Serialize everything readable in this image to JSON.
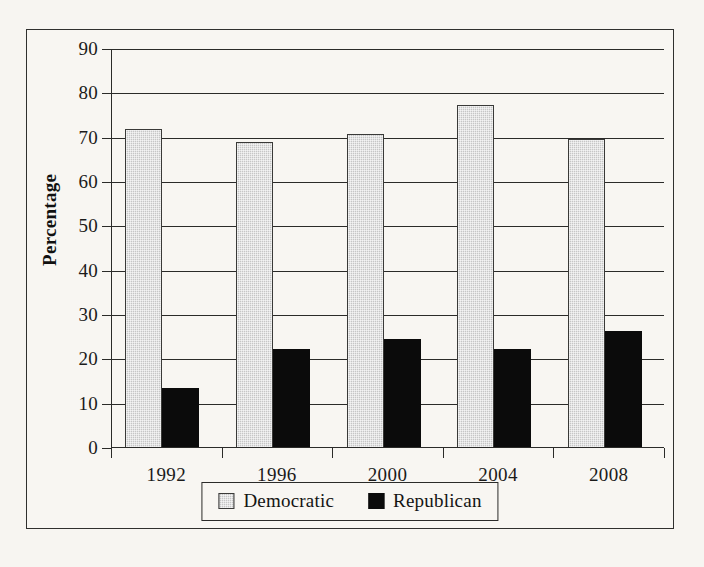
{
  "figure": {
    "background_color": "#f7f5f1",
    "frame_color": "#30302e"
  },
  "chart_data": {
    "type": "bar",
    "title": "",
    "xlabel": "",
    "ylabel": "Percentage",
    "ylim": [
      0,
      90
    ],
    "ytick_values": [
      0,
      10,
      20,
      30,
      40,
      50,
      60,
      70,
      80,
      90
    ],
    "ytick_labels": [
      "0",
      "10",
      "20",
      "30",
      "40",
      "50",
      "60",
      "70",
      "80",
      "90"
    ],
    "grid": true,
    "grid_axis": "y",
    "legend_position": "bottom-center",
    "categories": [
      "1992",
      "1996",
      "2000",
      "2004",
      "2008"
    ],
    "series": [
      {
        "name": "Democratic",
        "color": "#c6c6c6",
        "edge_color": "#3a3a38",
        "values": [
          72.0,
          69.0,
          70.8,
          77.4,
          69.8
        ]
      },
      {
        "name": "Republican",
        "color": "#0b0b0b",
        "edge_color": "#0b0b0b",
        "values": [
          13.5,
          22.3,
          24.6,
          22.3,
          26.4
        ]
      }
    ]
  },
  "legend": {
    "entries": [
      {
        "label": "Democratic",
        "swatch": "light-gray-hatched-square"
      },
      {
        "label": "Republican",
        "swatch": "solid-black-square"
      }
    ]
  }
}
